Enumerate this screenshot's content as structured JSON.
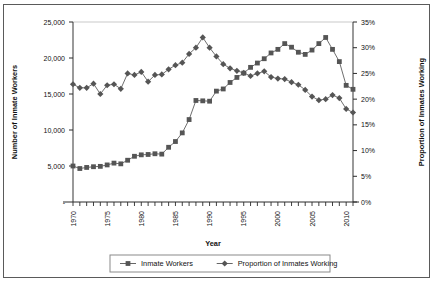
{
  "chart_data": {
    "type": "line",
    "title": "",
    "xlabel": "Year",
    "ylabel": "Number of Inmate Workers",
    "y2label": "Proportion of Inmates Working",
    "grid": false,
    "legend_position": "bottom",
    "xlim": [
      1970,
      2011
    ],
    "ylim": [
      0,
      25000
    ],
    "y2lim": [
      0,
      0.35
    ],
    "x": [
      1970,
      1971,
      1972,
      1973,
      1974,
      1975,
      1976,
      1977,
      1978,
      1979,
      1980,
      1981,
      1982,
      1983,
      1984,
      1985,
      1986,
      1987,
      1988,
      1989,
      1990,
      1991,
      1992,
      1993,
      1994,
      1995,
      1996,
      1997,
      1998,
      1999,
      2000,
      2001,
      2002,
      2003,
      2004,
      2005,
      2006,
      2007,
      2008,
      2009,
      2010,
      2011
    ],
    "xticklabels": [
      "1970",
      "1975",
      "1980",
      "1985",
      "1990",
      "1995",
      "2000",
      "2005",
      "2010"
    ],
    "xtickvalues": [
      1970,
      1975,
      1980,
      1985,
      1990,
      1995,
      2000,
      2005,
      2010
    ],
    "yticklabels": [
      "-",
      "5,000",
      "10,000",
      "15,000",
      "20,000",
      "25,000"
    ],
    "ytickvalues": [
      0,
      5000,
      10000,
      15000,
      20000,
      25000
    ],
    "y2ticklabels": [
      "0%",
      "5%",
      "10%",
      "15%",
      "20%",
      "25%",
      "30%",
      "35%"
    ],
    "y2tickvalues": [
      0,
      0.05,
      0.1,
      0.15,
      0.2,
      0.25,
      0.3,
      0.35
    ],
    "series": [
      {
        "name": "Inmate Workers",
        "axis": "left",
        "marker": "square",
        "color": "#555555",
        "values": [
          5000,
          4650,
          4800,
          4900,
          4950,
          5150,
          5400,
          5300,
          5800,
          6350,
          6550,
          6600,
          6700,
          6650,
          7600,
          8400,
          9600,
          11450,
          14100,
          14050,
          14000,
          15400,
          15700,
          16600,
          17300,
          17900,
          18700,
          19300,
          19900,
          20700,
          21200,
          22000,
          21500,
          20800,
          20500,
          21100,
          22000,
          22850,
          21200,
          19500,
          16200,
          15650
        ]
      },
      {
        "name": "Proportion of Inmates Working",
        "axis": "right",
        "marker": "diamond",
        "color": "#555555",
        "values": [
          0.229,
          0.222,
          0.222,
          0.23,
          0.21,
          0.227,
          0.229,
          0.22,
          0.25,
          0.247,
          0.253,
          0.234,
          0.247,
          0.248,
          0.258,
          0.266,
          0.271,
          0.288,
          0.3,
          0.32,
          0.3,
          0.283,
          0.268,
          0.26,
          0.255,
          0.251,
          0.245,
          0.25,
          0.254,
          0.243,
          0.24,
          0.239,
          0.233,
          0.228,
          0.218,
          0.205,
          0.198,
          0.2,
          0.208,
          0.202,
          0.181,
          0.174
        ]
      }
    ]
  },
  "legend": {
    "items": [
      {
        "label": "Inmate Workers",
        "marker": "square"
      },
      {
        "label": "Proportion of Inmates Working",
        "marker": "diamond"
      }
    ]
  },
  "axes": {
    "left_title": "Number of Inmate Workers",
    "right_title": "Proportion of Inmates Working",
    "bottom_title": "Year"
  },
  "colors": {
    "series": "#555555",
    "axis": "#6f6f6f",
    "text": "#111111",
    "frame": "#5a5a5a",
    "background": "#ffffff"
  }
}
